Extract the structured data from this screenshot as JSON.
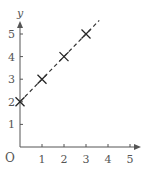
{
  "chart_data": {
    "type": "scatter",
    "title": "",
    "xlabel": "",
    "ylabel": "y",
    "origin_label": "O",
    "xlim": [
      0,
      5.5
    ],
    "ylim": [
      0,
      6
    ],
    "x_ticks": [
      "1",
      "2",
      "3",
      "4",
      "5"
    ],
    "y_ticks": [
      "1",
      "2",
      "3",
      "4",
      "5"
    ],
    "grid": false,
    "legend": null,
    "series": [
      {
        "name": "points",
        "marker": "x",
        "x": [
          0,
          1,
          2,
          3
        ],
        "y": [
          2,
          3,
          4,
          5
        ]
      },
      {
        "name": "line y = x + 2",
        "style": "dashed",
        "x": [
          0,
          3.6
        ],
        "y": [
          2,
          5.6
        ]
      }
    ]
  },
  "colors": {
    "axis": "#555555",
    "line": "#333333",
    "marker": "#222222"
  }
}
